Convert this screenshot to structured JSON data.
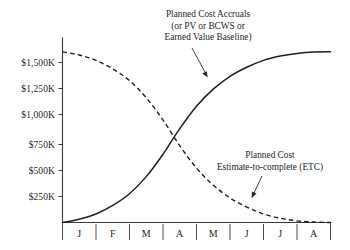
{
  "chart_data": {
    "type": "line",
    "title": "",
    "xlabel": "",
    "ylabel": "",
    "grid": false,
    "legend_position": "inline-annotations",
    "x_categories": [
      "J",
      "F",
      "M",
      "A",
      "M",
      "J",
      "J",
      "A"
    ],
    "y_tick_labels": [
      "$1,500K",
      "$1,250K",
      "$1,000K",
      "$750K",
      "$500K",
      "$250K"
    ],
    "y_tick_values": [
      1500,
      1250,
      1000,
      750,
      500,
      250
    ],
    "ylim": [
      0,
      1625
    ],
    "xlim": [
      0,
      8
    ],
    "budget_at_completion": 1600,
    "crossover_point": {
      "x": "mid-A",
      "y": 875
    },
    "series": [
      {
        "name": "Planned Cost Accruals",
        "style": "solid",
        "x": [
          0,
          0.5,
          1,
          1.5,
          2,
          2.5,
          3,
          3.5,
          4,
          4.5,
          5,
          5.5,
          6,
          6.5,
          7,
          7.5,
          8
        ],
        "values": [
          0,
          30,
          80,
          160,
          270,
          430,
          640,
          880,
          1090,
          1250,
          1370,
          1455,
          1520,
          1560,
          1585,
          1598,
          1600
        ]
      },
      {
        "name": "Planned Cost Estimate-to-complete (ETC)",
        "style": "dashed",
        "x": [
          0,
          0.5,
          1,
          1.5,
          2,
          2.5,
          3,
          3.5,
          4,
          4.5,
          5,
          5.5,
          6,
          6.5,
          7,
          7.5,
          8
        ],
        "values": [
          1600,
          1570,
          1520,
          1440,
          1330,
          1170,
          960,
          720,
          510,
          350,
          230,
          145,
          80,
          40,
          15,
          4,
          0
        ]
      }
    ],
    "annotations": [
      {
        "id": "pv-annotation",
        "lines": [
          "Planned Cost Accruals",
          "(or PV or BCWS or",
          "Earned Value Baseline)"
        ],
        "target_series": "Planned Cost Accruals"
      },
      {
        "id": "etc-annotation",
        "lines": [
          "Planned Cost",
          "Estimate-to-complete (ETC)"
        ],
        "target_series": "Planned Cost Estimate-to-complete (ETC)"
      }
    ],
    "colors": {
      "curve": "#1f1f1f",
      "axis": "#3a3a3a",
      "text": "#262626",
      "background": "#ffffff"
    }
  }
}
